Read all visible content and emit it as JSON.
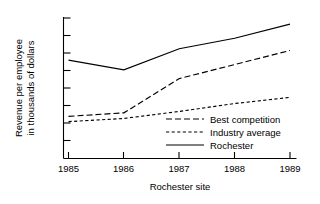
{
  "chart_data": {
    "type": "line",
    "title": "",
    "xlabel": "Rochester site",
    "ylabel_line1": "Revenue per employee",
    "ylabel_line2": "in thousands of dollars",
    "categories": [
      "1985",
      "1986",
      "1987",
      "1988",
      "1989"
    ],
    "x": [
      1985,
      1986,
      1987,
      1988,
      1989
    ],
    "xlim": [
      1985,
      1989
    ],
    "ylim": [
      0,
      8
    ],
    "y_tick_count": 8,
    "y_tick_labels": [],
    "grid": false,
    "legend_position": "inside-lower-right",
    "series": [
      {
        "name": "Best competition",
        "style": "long-dash",
        "values": [
          2.4,
          2.6,
          4.55,
          5.35,
          6.15
        ]
      },
      {
        "name": "Industry average",
        "style": "short-dash",
        "values": [
          2.1,
          2.28,
          2.68,
          3.13,
          3.48
        ]
      },
      {
        "name": "Rochester",
        "style": "solid",
        "values": [
          5.6,
          5.05,
          6.25,
          6.85,
          7.65
        ]
      }
    ]
  },
  "axes": {
    "x_tick_labels": [
      "1985",
      "1986",
      "1987",
      "1988",
      "1989"
    ],
    "x_axis_title": "Rochester site",
    "y_axis_title_line1": "Revenue per employee",
    "y_axis_title_line2": "in thousands of dollars"
  },
  "legend": {
    "entries": [
      {
        "label": "Best competition",
        "style": "long-dash"
      },
      {
        "label": "Industry average",
        "style": "short-dash"
      },
      {
        "label": "Rochester",
        "style": "solid"
      }
    ]
  },
  "colors": {
    "ink": "#000000",
    "background": "#ffffff"
  }
}
